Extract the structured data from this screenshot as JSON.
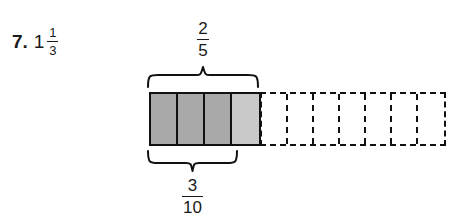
{
  "problem": {
    "number": "7.",
    "mixed_number": {
      "whole": "1",
      "numerator": "1",
      "denominator": "3"
    }
  },
  "diagram": {
    "type": "fraction-bar-model",
    "top_label": {
      "numerator": "2",
      "denominator": "5"
    },
    "bottom_label": {
      "numerator": "3",
      "denominator": "10"
    },
    "solid_bar": {
      "cells": [
        {
          "shade": "dark"
        },
        {
          "shade": "dark"
        },
        {
          "shade": "dark"
        },
        {
          "shade": "light"
        }
      ]
    },
    "dashed_bar": {
      "cells": [
        {
          "shade": "none"
        },
        {
          "shade": "none"
        },
        {
          "shade": "none"
        },
        {
          "shade": "none"
        },
        {
          "shade": "none"
        },
        {
          "shade": "none"
        },
        {
          "shade": "none"
        }
      ]
    },
    "colors": {
      "dark_shade": "#a9a9a9",
      "light_shade": "#c9c9c9",
      "outline": "#111111",
      "text": "#1a1a1a",
      "background": "#ffffff"
    }
  }
}
